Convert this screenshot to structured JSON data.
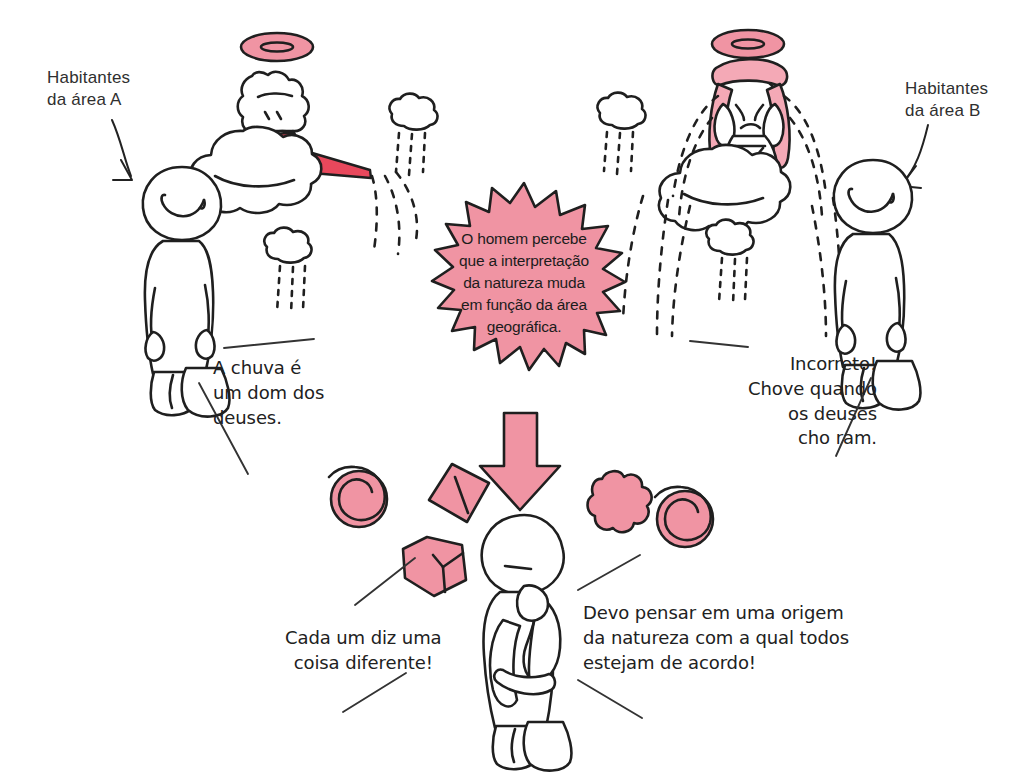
{
  "scene": {
    "title": "O homem percebe que a interpretação da natureza muda em função da área geográfica",
    "palette": {
      "pink": "#F094A3",
      "pink_light": "#F4A9B6",
      "red": "#E8485C",
      "ink": "#1f1f1f",
      "paper": "#ffffff"
    }
  },
  "labels": {
    "area_a": "Habitantes\nda área A",
    "area_b": "Habitantes\nda área B"
  },
  "burst": {
    "text": "O homem percebe\nque a interpretação\nda natureza muda\nem função da área\ngeográfica."
  },
  "captions": {
    "left": "A chuva é\num dom dos\ndeuses.",
    "right": "Incorreto!\nChove quando\nos deuses\ncho ram.",
    "right_fixed": "Incorreto!\nChove quando\nos deuses\ncho­ram.",
    "bottom_left": "Cada um diz uma\ncoisa diferente!",
    "bottom_right": "Devo pensar em uma origem\nda natureza com a qual todos\nestejam de acordo!"
  },
  "figures": {
    "angel_left": "angel-watering-can",
    "angel_right": "angel-crying",
    "human_left": "standing-person-smiling",
    "human_right": "standing-person-smiling",
    "human_center": "thinking-person"
  },
  "shapes": [
    {
      "name": "spiral-left",
      "kind": "spiral"
    },
    {
      "name": "diamond",
      "kind": "diamond"
    },
    {
      "name": "cube",
      "kind": "cube"
    },
    {
      "name": "flower",
      "kind": "flower"
    },
    {
      "name": "spiral-right",
      "kind": "spiral"
    },
    {
      "name": "down-arrow",
      "kind": "arrow"
    }
  ]
}
